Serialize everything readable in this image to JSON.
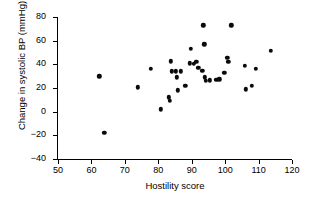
{
  "chart_data": {
    "type": "scatter",
    "title": "",
    "xlabel": "Hostility score",
    "ylabel": "Change in systolic BP (mmHg)",
    "xlim": [
      50,
      120
    ],
    "ylim": [
      -40,
      80
    ],
    "xticks": [
      50,
      60,
      70,
      80,
      90,
      100,
      110,
      120
    ],
    "yticks": [
      -40,
      -20,
      0,
      20,
      40,
      60,
      80
    ],
    "grid": false,
    "legend": null,
    "marker": {
      "shape": "circle",
      "color": "#0a0a0a",
      "size": 4.4
    },
    "n_points": 36,
    "points": [
      {
        "x": 62.3,
        "y": 30.0
      },
      {
        "x": 63.8,
        "y": -18.0
      },
      {
        "x": 73.9,
        "y": 20.5
      },
      {
        "x": 77.8,
        "y": 36.0
      },
      {
        "x": 80.7,
        "y": 2.0
      },
      {
        "x": 83.2,
        "y": 12.0
      },
      {
        "x": 83.5,
        "y": 9.0
      },
      {
        "x": 83.8,
        "y": 42.5
      },
      {
        "x": 84.0,
        "y": 34.0
      },
      {
        "x": 85.3,
        "y": 34.0
      },
      {
        "x": 85.6,
        "y": 29.0
      },
      {
        "x": 85.9,
        "y": 18.0
      },
      {
        "x": 88.1,
        "y": 22.0
      },
      {
        "x": 89.4,
        "y": 41.0
      },
      {
        "x": 89.7,
        "y": 53.0
      },
      {
        "x": 91.4,
        "y": 42.0
      },
      {
        "x": 92.0,
        "y": 37.0
      },
      {
        "x": 93.2,
        "y": 34.5
      },
      {
        "x": 93.5,
        "y": 73.0
      },
      {
        "x": 93.8,
        "y": 57.0
      },
      {
        "x": 94.0,
        "y": 29.0
      },
      {
        "x": 94.3,
        "y": 26.0
      },
      {
        "x": 97.4,
        "y": 27.0
      },
      {
        "x": 99.8,
        "y": 33.0
      },
      {
        "x": 100.6,
        "y": 45.5
      },
      {
        "x": 100.9,
        "y": 42.0
      },
      {
        "x": 101.8,
        "y": 73.0
      },
      {
        "x": 105.8,
        "y": 39.0
      },
      {
        "x": 106.1,
        "y": 19.0
      },
      {
        "x": 107.9,
        "y": 22.0
      },
      {
        "x": 109.2,
        "y": 36.0
      },
      {
        "x": 113.6,
        "y": 51.5
      },
      {
        "x": 86.8,
        "y": 34.0
      },
      {
        "x": 90.6,
        "y": 40.5
      },
      {
        "x": 95.5,
        "y": 26.5
      },
      {
        "x": 98.2,
        "y": 27.5
      }
    ]
  }
}
